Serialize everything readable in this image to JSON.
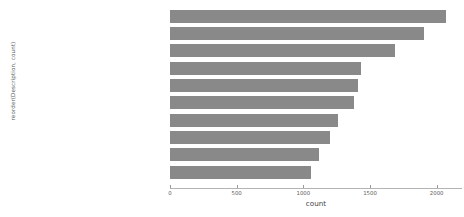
{
  "chart_data": {
    "type": "bar",
    "orientation": "horizontal",
    "title": "",
    "xlabel": "count",
    "ylabel": "reorder(Description, count)",
    "xlim": [
      0,
      2190
    ],
    "xticks": [
      0,
      500,
      1000,
      1500,
      2000
    ],
    "xticklabels": [
      "0",
      "500",
      "1000",
      "1500",
      "2000"
    ],
    "grid": false,
    "legend": null,
    "bar_color": "#898989",
    "background_color": "#ffffff",
    "categories": [
      "WHITE HANGING HEART T-LIGHT HOLDER",
      "REGENCY CAKESTAND 3 TIER",
      "JUMBO BAG RED RETROSPOT",
      "ASSORTED COLOUR BIRD ORNAMENT",
      "PARTY BUNTING",
      "LUNCH BAG RED RETROSPOT",
      "SET OF 3 CAKE TINS PANTRY DESIGN",
      "POSTAGE",
      "LUNCH BAG  BLACK SKULL.",
      "PACK OF 72 RETROSPOT CAKE CASES"
    ],
    "values": [
      2070,
      1905,
      1690,
      1430,
      1410,
      1380,
      1260,
      1200,
      1120,
      1060
    ]
  }
}
